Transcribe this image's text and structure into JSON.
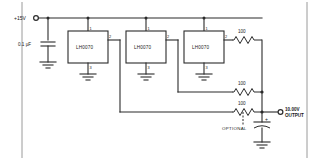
{
  "diagram": {
    "supply_label": "+15V",
    "decoupling_cap_label": "0.1 µF",
    "output_label_line1": "10.00V",
    "output_label_line2": "OUTPUT",
    "optional_label": "OPTIONAL",
    "polarity_mark": "+",
    "ics": [
      {
        "name": "LH0070",
        "pin_in": "1",
        "pin_out": "2",
        "pin_gnd": "3"
      },
      {
        "name": "LH0070",
        "pin_in": "1",
        "pin_out": "2",
        "pin_gnd": "3"
      },
      {
        "name": "LH0070",
        "pin_in": "1",
        "pin_out": "2",
        "pin_gnd": "3"
      }
    ],
    "resistors": [
      {
        "value": "100"
      },
      {
        "value": "100"
      },
      {
        "value": "100"
      }
    ],
    "colors": {
      "wire": "#2b2b2b",
      "background": "#ffffff",
      "frame": "#9a9a9a"
    }
  }
}
